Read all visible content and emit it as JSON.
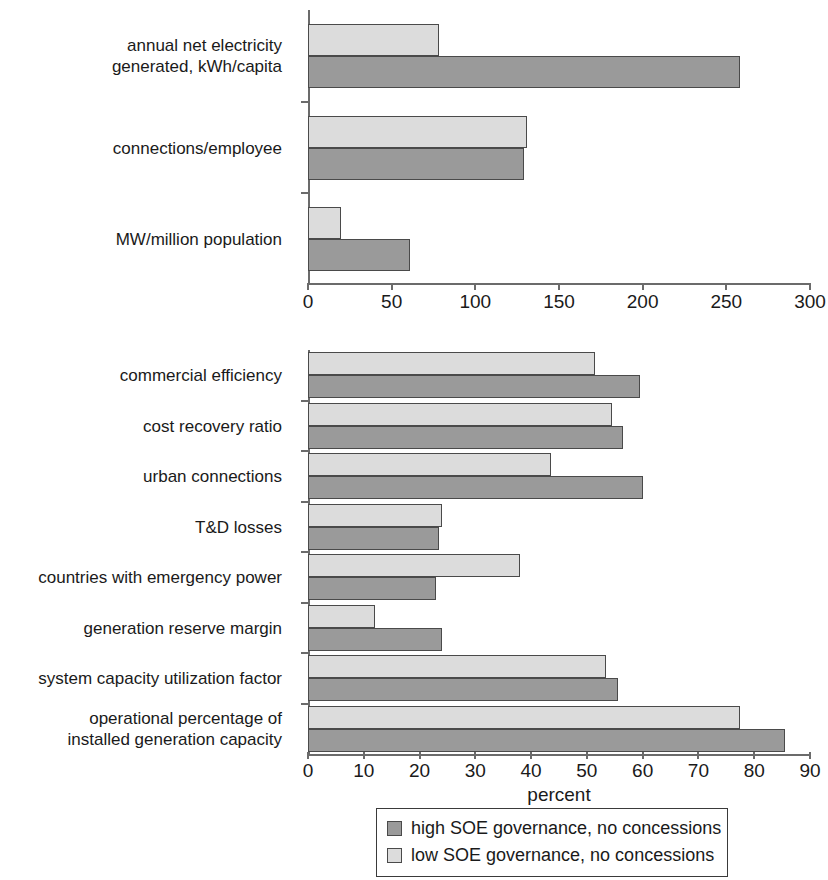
{
  "chart_data": [
    {
      "type": "bar",
      "orientation": "horizontal",
      "title": "",
      "subtitle": "",
      "xlabel": "",
      "ylabel": "",
      "xlim": [
        0,
        300
      ],
      "xticks": [
        0,
        50,
        100,
        150,
        200,
        250,
        300
      ],
      "xtick_labels": [
        "0",
        "50",
        "100",
        "150",
        "200",
        "250",
        "300"
      ],
      "grid": false,
      "categories": [
        "annual net electricity\ngenerated, kWh/capita",
        "connections/employee",
        "MW/million population"
      ],
      "series": [
        {
          "name": "low SOE governance, no concessions",
          "color": "#dcdcdc",
          "values": [
            78,
            131,
            20
          ]
        },
        {
          "name": "high SOE governance, no concessions",
          "color": "#9a9a9a",
          "values": [
            258,
            129,
            61
          ]
        }
      ]
    },
    {
      "type": "bar",
      "orientation": "horizontal",
      "title": "",
      "subtitle": "",
      "xlabel": "percent",
      "ylabel": "",
      "xlim": [
        0,
        90
      ],
      "xticks": [
        0,
        10,
        20,
        30,
        40,
        50,
        60,
        70,
        80,
        90
      ],
      "xtick_labels": [
        "0",
        "10",
        "20",
        "30",
        "40",
        "50",
        "60",
        "70",
        "80",
        "90"
      ],
      "grid": false,
      "legend_position": "bottom",
      "categories": [
        "commercial efficiency",
        "cost recovery ratio",
        "urban connections",
        "T&D losses",
        "countries with emergency power",
        "generation reserve margin",
        "system capacity utilization factor",
        "operational percentage of\ninstalled generation capacity"
      ],
      "series": [
        {
          "name": "low SOE governance, no concessions",
          "color": "#dcdcdc",
          "values": [
            51.5,
            54.5,
            43.5,
            24.0,
            38.0,
            12.0,
            53.5,
            77.5
          ]
        },
        {
          "name": "high SOE governance, no concessions",
          "color": "#9a9a9a",
          "values": [
            59.5,
            56.5,
            60.0,
            23.5,
            23.0,
            24.0,
            55.5,
            85.5
          ]
        }
      ]
    }
  ],
  "legend": {
    "entries": [
      {
        "label": "high SOE governance, no concessions",
        "color": "#9a9a9a",
        "swatch": "dark"
      },
      {
        "label": "low SOE governance, no concessions",
        "color": "#dcdcdc",
        "swatch": "light"
      }
    ]
  }
}
